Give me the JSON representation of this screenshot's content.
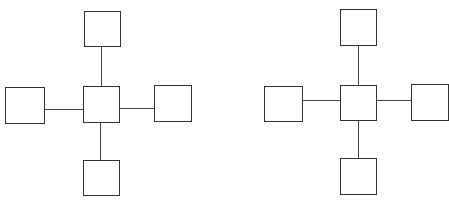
{
  "diagrams": [
    {
      "name": "star-topology-left",
      "nodes": [
        "center",
        "top",
        "left",
        "right",
        "bottom"
      ],
      "edges": [
        [
          "center",
          "top"
        ],
        [
          "center",
          "left"
        ],
        [
          "center",
          "right"
        ],
        [
          "center",
          "bottom"
        ]
      ]
    },
    {
      "name": "star-topology-right",
      "nodes": [
        "center",
        "top",
        "left",
        "right",
        "bottom"
      ],
      "edges": [
        [
          "center",
          "top"
        ],
        [
          "center",
          "left"
        ],
        [
          "center",
          "right"
        ],
        [
          "center",
          "bottom"
        ]
      ]
    }
  ],
  "colors": {
    "stroke": "#333333",
    "background": "#ffffff"
  }
}
